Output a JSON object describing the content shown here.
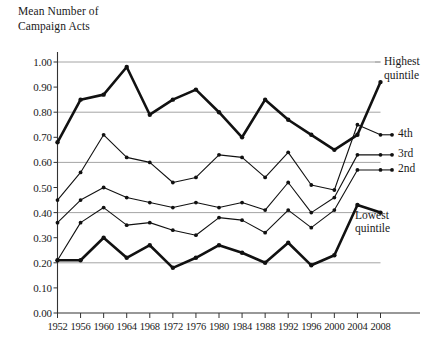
{
  "chart_data": {
    "type": "line",
    "title": "Mean Number of\nCampaign Acts",
    "xlabel": "",
    "ylabel": "Mean Number of Campaign Acts",
    "grid": true,
    "grid_values": [
      0.2,
      0.4,
      0.6,
      0.8,
      1.0
    ],
    "legend_position": "right-inline",
    "x": [
      1952,
      1956,
      1960,
      1964,
      1968,
      1972,
      1976,
      1980,
      1984,
      1988,
      1992,
      1996,
      2000,
      2004,
      2008
    ],
    "categories": [
      "1952",
      "1956",
      "1960",
      "1964",
      "1968",
      "1972",
      "1976",
      "1980",
      "1984",
      "1988",
      "1992",
      "1996",
      "2000",
      "2004",
      "2008"
    ],
    "xlim": [
      1952,
      2008
    ],
    "ylim": [
      0.0,
      1.0
    ],
    "ytick_labels": [
      "0.00",
      "0.10",
      "0.20",
      "0.30",
      "0.40",
      "0.50",
      "0.60",
      "0.70",
      "0.80",
      "0.90",
      "1.00"
    ],
    "ytick_values": [
      0.0,
      0.1,
      0.2,
      0.3,
      0.4,
      0.5,
      0.6,
      0.7,
      0.8,
      0.9,
      1.0
    ],
    "series": [
      {
        "name": "Highest quintile",
        "label": "Highest\nquintile",
        "color": "#111111",
        "width": 2.6,
        "values": [
          0.68,
          0.85,
          0.87,
          0.98,
          0.79,
          0.85,
          0.89,
          0.8,
          0.7,
          0.85,
          0.77,
          0.71,
          0.65,
          0.71,
          0.92
        ]
      },
      {
        "name": "4th",
        "label": "4th",
        "color": "#111111",
        "width": 1.1,
        "values": [
          0.45,
          0.56,
          0.71,
          0.62,
          0.6,
          0.52,
          0.54,
          0.63,
          0.62,
          0.54,
          0.64,
          0.51,
          0.49,
          0.75,
          0.71
        ]
      },
      {
        "name": "3rd",
        "label": "3rd",
        "color": "#111111",
        "width": 1.1,
        "values": [
          0.36,
          0.45,
          0.5,
          0.46,
          0.44,
          0.42,
          0.44,
          0.42,
          0.44,
          0.41,
          0.52,
          0.4,
          0.46,
          0.63,
          0.63
        ]
      },
      {
        "name": "2nd",
        "label": "2nd",
        "color": "#111111",
        "width": 1.1,
        "values": [
          0.21,
          0.36,
          0.42,
          0.35,
          0.36,
          0.33,
          0.31,
          0.38,
          0.37,
          0.32,
          0.41,
          0.34,
          0.41,
          0.57,
          0.57
        ]
      },
      {
        "name": "Lowest quintile",
        "label": "Lowest\nquintile",
        "color": "#111111",
        "width": 2.6,
        "values": [
          0.21,
          0.21,
          0.3,
          0.22,
          0.27,
          0.18,
          0.22,
          0.27,
          0.24,
          0.2,
          0.28,
          0.19,
          0.23,
          0.43,
          0.4
        ]
      }
    ]
  },
  "axis": {
    "y_axis_caption": "Mean Number of\nCampaign Acts"
  }
}
